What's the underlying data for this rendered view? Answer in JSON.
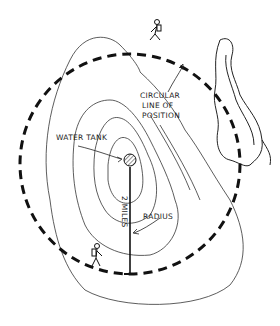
{
  "diagram": {
    "labels": {
      "water_tank": "WATER TANK",
      "circular_line_1": "CIRCULAR",
      "circular_line_2": "LINE OF",
      "circular_line_3": "POSITION",
      "distance": "2 MILES",
      "radius": "RADIUS"
    },
    "elements": {
      "center": "water-tank",
      "circle": "dashed circular line of position",
      "radius_line": "radius line from tank to circle",
      "hikers": 2,
      "terrain": "contour lines",
      "water": "river/lake shoreline"
    },
    "colors": {
      "ink": "#111111",
      "background": "#ffffff"
    }
  }
}
